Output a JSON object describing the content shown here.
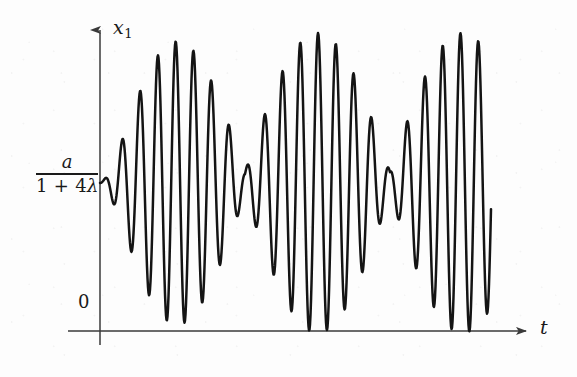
{
  "figure": {
    "kind": "line-plot",
    "background_color": "#fdfdfd",
    "ink_color": "#141414",
    "axis_color": "#3a3a3a"
  },
  "axes": {
    "y_axis": {
      "label": "x",
      "label_subscript": "1",
      "name": "x_1",
      "x_px": 100,
      "top_px": 26,
      "bottom_px": 345,
      "arrow": "up"
    },
    "x_axis": {
      "label": "t",
      "y_px": 331,
      "left_px": 68,
      "right_px": 532,
      "arrow": "right"
    },
    "origin_label": "0",
    "equilibrium_label": {
      "numerator": "a",
      "denominator_prefix": "1 + 4",
      "denominator_symbol": "λ",
      "full_text": "a / (1 + 4λ)",
      "value_y_px": 183
    }
  },
  "chart_data": {
    "type": "line",
    "title": "",
    "xlabel": "t",
    "ylabel": "x_1",
    "grid": false,
    "legend": null,
    "baseline_label": "a/(1+4λ)",
    "baseline_y_px": 183,
    "zero_y_px": 331,
    "x_start_px": 100,
    "x_end_px": 491,
    "carrier_half_period_px": 8.9,
    "beat_period_px": 145,
    "beat_nodes_px": [
      265,
      410
    ],
    "beat_antinodes_px": [
      193,
      338,
      478
    ],
    "envelope_max_px": 150,
    "peak_tops_px": [
      162,
      134,
      103,
      84,
      73,
      70,
      77,
      93,
      116,
      142,
      163,
      171,
      166,
      150,
      127,
      103,
      82,
      70,
      68,
      74,
      90,
      112,
      138,
      161,
      173,
      170,
      155,
      131,
      106,
      84,
      70,
      63
    ],
    "trough_bottoms_px": [
      205,
      232,
      263,
      282,
      294,
      297,
      290,
      274,
      251,
      225,
      203,
      195,
      201,
      216,
      239,
      263,
      284,
      297,
      299,
      293,
      277,
      254,
      228,
      206,
      193,
      197,
      212,
      236,
      260,
      283,
      297,
      304
    ]
  }
}
